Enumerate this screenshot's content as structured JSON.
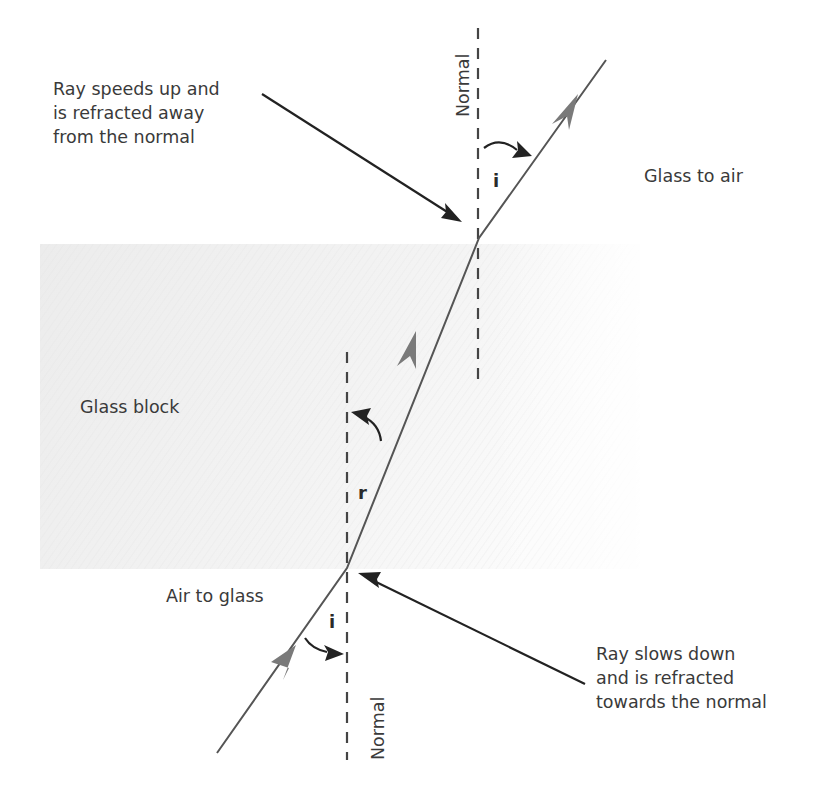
{
  "diagram": {
    "regions": {
      "glass_block_label": "Glass block"
    },
    "transitions": {
      "glass_to_air": "Glass to air",
      "air_to_glass": "Air to glass"
    },
    "annotations": {
      "speeds_up": [
        "Ray speeds up and",
        "is refracted away",
        "from the normal"
      ],
      "slows_down": [
        "Ray slows down",
        "and is refracted",
        "towards the normal"
      ]
    },
    "normals": {
      "top_label": "Normal",
      "bottom_label": "Normal"
    },
    "angles": {
      "top_incidence": "i",
      "refraction": "r",
      "bottom_incidence": "i"
    },
    "colors": {
      "ray": "#555555",
      "ray_arrowhead": "#777777",
      "pointer_arrow": "#222222",
      "normal_dash": "#444444",
      "glass_fill": "#eeeeee",
      "text": "#3a3a3a"
    }
  }
}
